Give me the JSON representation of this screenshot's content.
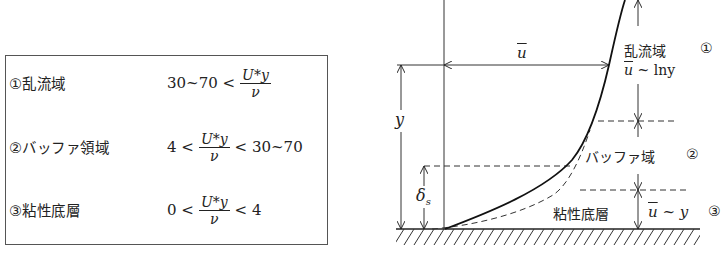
{
  "table": {
    "rows": [
      {
        "label": "①乱流域",
        "left": "30~70 <",
        "numerator": "U*y",
        "denominator": "ν",
        "right": ""
      },
      {
        "label": "②バッファ領域",
        "left": "4 <",
        "numerator": "U*y",
        "denominator": "ν",
        "right": "< 30~70"
      },
      {
        "label": "③粘性底層",
        "left": "0 <",
        "numerator": "U*y",
        "denominator": "ν",
        "right": "< 4"
      }
    ]
  },
  "diagram": {
    "velocity_label": "u",
    "height_label": "y",
    "sublayer_thickness_label": "δ",
    "sublayer_thickness_subscript": "s",
    "regions": [
      {
        "name": "乱流域",
        "number": "①",
        "law_u": "u",
        "law_rest": " ~ lny"
      },
      {
        "name": "バッファ域",
        "number": "②"
      },
      {
        "name": "粘性底層",
        "number": "③",
        "law_u": "u",
        "law_rest": " ~ y"
      }
    ],
    "colors": {
      "line": "#222222",
      "frame": "#555555"
    }
  }
}
